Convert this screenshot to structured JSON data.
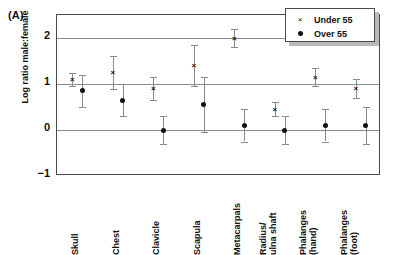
{
  "panel": {
    "label": "(A)"
  },
  "legend": {
    "entries": [
      {
        "symbol": "x-marker-icon",
        "glyph": "×",
        "label": "Under 55"
      },
      {
        "symbol": "dot-marker-icon",
        "glyph": "●",
        "label": "Over 55"
      }
    ]
  },
  "axes": {
    "ylabel": "Log ratio male:female",
    "yticks": [
      "2",
      "1",
      "0",
      "−1"
    ],
    "ylim": [
      -1,
      2.5
    ],
    "gridlines": [
      2,
      1,
      0
    ]
  },
  "chart_data": {
    "type": "scatter",
    "title": "",
    "xlabel": "",
    "ylabel": "Log ratio male:female",
    "ylim": [
      -1,
      2.5
    ],
    "grid": true,
    "legend_position": "top-right",
    "categories": [
      "Skull",
      "Chest",
      "Clavicle",
      "Scapula",
      "Metacarpals",
      "Radius/\nulna shaft",
      "Phalanges\n(hand)",
      "Phalanges\n(foot)"
    ],
    "series": [
      {
        "name": "Under 55",
        "marker": "x",
        "values": [
          1.1,
          1.25,
          0.9,
          1.4,
          2.0,
          0.45,
          1.15,
          0.9
        ],
        "ci_low": [
          0.95,
          0.9,
          0.65,
          0.95,
          1.8,
          0.3,
          0.95,
          0.7
        ],
        "ci_high": [
          1.25,
          1.6,
          1.15,
          1.85,
          2.2,
          0.6,
          1.35,
          1.1
        ]
      },
      {
        "name": "Over 55",
        "marker": "o",
        "values": [
          0.85,
          0.65,
          0.0,
          0.55,
          0.1,
          0.0,
          0.1,
          0.1
        ],
        "ci_low": [
          0.5,
          0.3,
          -0.3,
          -0.05,
          -0.25,
          -0.3,
          -0.25,
          -0.3
        ],
        "ci_high": [
          1.2,
          1.0,
          0.3,
          1.15,
          0.45,
          0.3,
          0.45,
          0.5
        ]
      }
    ]
  }
}
